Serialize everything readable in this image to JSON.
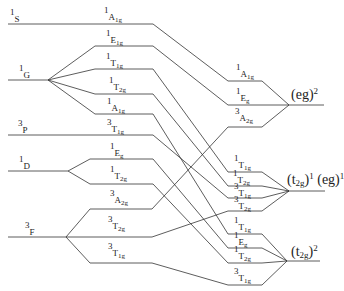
{
  "diagram": {
    "type": "energy-level correlation diagram",
    "line_color": "#333333",
    "free_ion_terms": [
      {
        "id": "1S",
        "mult": "1",
        "L": "S",
        "y": 24
      },
      {
        "id": "1G",
        "mult": "1",
        "L": "G",
        "y": 80
      },
      {
        "id": "3P",
        "mult": "3",
        "L": "P",
        "y": 135
      },
      {
        "id": "1D",
        "mult": "1",
        "L": "D",
        "y": 171
      },
      {
        "id": "3F",
        "mult": "3",
        "L": "F",
        "y": 237
      }
    ],
    "weak_field_states": [
      {
        "mult": "1",
        "sym": "A",
        "sub": "1g",
        "from": "1S",
        "y": 24
      },
      {
        "mult": "1",
        "sym": "E",
        "sub": "1g",
        "from": "1G",
        "y": 46
      },
      {
        "mult": "1",
        "sym": "T",
        "sub": "1g",
        "from": "1G",
        "y": 69
      },
      {
        "mult": "1",
        "sym": "T",
        "sub": "2g",
        "from": "1G",
        "y": 94
      },
      {
        "mult": "1",
        "sym": "A",
        "sub": "1g",
        "from": "1G",
        "y": 114
      },
      {
        "mult": "3",
        "sym": "T",
        "sub": "1g",
        "from": "3P",
        "y": 135
      },
      {
        "mult": "1",
        "sym": "E",
        "sub": "g",
        "from": "1D",
        "y": 159
      },
      {
        "mult": "1",
        "sym": "T",
        "sub": "2g",
        "from": "1D",
        "y": 184
      },
      {
        "mult": "3",
        "sym": "A",
        "sub": "2g",
        "from": "3F",
        "y": 209
      },
      {
        "mult": "3",
        "sym": "T",
        "sub": "2g",
        "from": "3F",
        "y": 237
      },
      {
        "mult": "3",
        "sym": "T",
        "sub": "1g",
        "from": "3F",
        "y": 263
      }
    ],
    "strong_field_states": [
      {
        "mult": "1",
        "sym": "A",
        "sub": "1g",
        "config": "eg2",
        "y": 81
      },
      {
        "mult": "1",
        "sym": "E",
        "sub": "g",
        "config": "eg2",
        "y": 105
      },
      {
        "mult": "3",
        "sym": "A",
        "sub": "2g",
        "config": "eg2",
        "y": 127
      },
      {
        "mult": "1",
        "sym": "T",
        "sub": "1g",
        "config": "t2g1eg1",
        "y": 172
      },
      {
        "mult": "1",
        "sym": "T",
        "sub": "2g",
        "config": "t2g1eg1",
        "y": 186
      },
      {
        "mult": "3",
        "sym": "T",
        "sub": "1g",
        "config": "t2g1eg1",
        "y": 198
      },
      {
        "mult": "3",
        "sym": "T",
        "sub": "2g",
        "config": "t2g1eg1",
        "y": 211
      },
      {
        "mult": "1",
        "sym": "T",
        "sub": "1g",
        "config": "t2g2",
        "y": 234
      },
      {
        "mult": "1",
        "sym": "E",
        "sub": "g",
        "config": "t2g2",
        "y": 248
      },
      {
        "mult": "1",
        "sym": "T",
        "sub": "2g",
        "config": "t2g2",
        "y": 263
      },
      {
        "mult": "3",
        "sym": "T",
        "sub": "1g",
        "config": "t2g2",
        "y": 285
      }
    ],
    "configurations": [
      {
        "id": "eg2",
        "label": "(eg)",
        "sup": "2",
        "y": 105
      },
      {
        "id": "t2g1eg1",
        "label_a": "(t",
        "sub_a": "2g",
        "close_a": ")",
        "sup_a": "1",
        "label_b": " (eg)",
        "sup_b": "1",
        "y": 191
      },
      {
        "id": "t2g2",
        "label": "(t",
        "sub": "2g",
        "close": ")",
        "sup": "2",
        "y": 261
      }
    ]
  }
}
